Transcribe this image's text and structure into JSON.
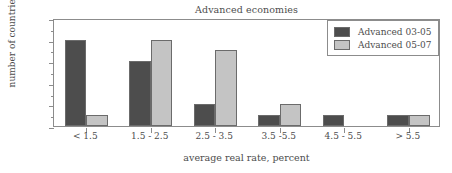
{
  "chart_data": {
    "type": "bar",
    "title": "Advanced economies",
    "xlabel": "average real rate, percent",
    "ylabel": "number of countries",
    "categories": [
      "< 1.5",
      "1.5 - 2.5",
      "2.5 - 3.5",
      "3.5 -5.5",
      "4.5 - 5.5",
      "> 5.5"
    ],
    "series": [
      {
        "name": "Advanced 03-05",
        "color": "#4d4d4d",
        "values": [
          8,
          6,
          2,
          1,
          1,
          1
        ]
      },
      {
        "name": "Advanced 05-07",
        "color": "#c4c4c4",
        "values": [
          1,
          8,
          7,
          2,
          0,
          1
        ]
      }
    ],
    "ylim": [
      0,
      10
    ],
    "ytick_labels": [
      "0",
      "2",
      "4",
      "6",
      "8",
      "10"
    ],
    "ytick_values": [
      0,
      2,
      4,
      6,
      8,
      10
    ],
    "yminor_values": [
      1,
      3,
      5,
      7,
      9
    ],
    "grid": false,
    "legend_position": "top-right"
  },
  "legend": {
    "entries": [
      {
        "label": "Advanced 03-05"
      },
      {
        "label": "Advanced 05-07"
      }
    ]
  }
}
